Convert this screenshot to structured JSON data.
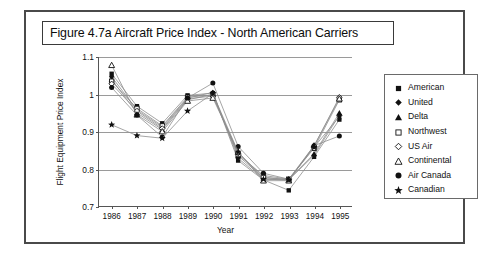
{
  "figure": {
    "title": "Figure 4.7a  Aircraft Price Index - North American Carriers"
  },
  "legend": {
    "items": [
      {
        "label": "American",
        "marker": "filled-square-marker"
      },
      {
        "label": "United",
        "marker": "filled-diamond-marker"
      },
      {
        "label": "Delta",
        "marker": "filled-triangle-marker"
      },
      {
        "label": "Northwest",
        "marker": "open-square-marker"
      },
      {
        "label": "US Air",
        "marker": "open-diamond-marker"
      },
      {
        "label": "Continental",
        "marker": "open-triangle-marker"
      },
      {
        "label": "Air Canada",
        "marker": "filled-circle-marker"
      },
      {
        "label": "Canadian",
        "marker": "star-marker"
      }
    ]
  },
  "chart_data": {
    "type": "line",
    "title": "Figure 4.7a  Aircraft Price Index - North American Carriers",
    "xlabel": "Year",
    "ylabel": "Flight Equipment Price Index",
    "x": [
      1986,
      1987,
      1988,
      1989,
      1990,
      1991,
      1992,
      1993,
      1994,
      1995
    ],
    "xticklabels": [
      "1986",
      "1987",
      "1988",
      "1989",
      "1990",
      "1991",
      "1992",
      "1993",
      "1994",
      "1995"
    ],
    "yticks": [
      0.7,
      0.8,
      0.9,
      1.0,
      1.1
    ],
    "yticklabels": [
      "0.7",
      "0.8",
      "0.9",
      "1",
      "1.1"
    ],
    "ylim": [
      0.7,
      1.1
    ],
    "grid": "horizontal",
    "legend_position": "right",
    "series": [
      {
        "name": "American",
        "marker": "filled-square-marker",
        "values": [
          1.055,
          0.968,
          0.922,
          0.997,
          1.003,
          0.822,
          0.77,
          0.742,
          0.832,
          0.932
        ]
      },
      {
        "name": "United",
        "marker": "filled-diamond-marker",
        "values": [
          1.047,
          0.958,
          0.912,
          0.99,
          1.005,
          0.828,
          0.772,
          0.77,
          0.836,
          0.944
        ]
      },
      {
        "name": "Delta",
        "marker": "filled-triangle-marker",
        "values": [
          1.04,
          0.95,
          0.905,
          0.985,
          1.0,
          0.835,
          0.775,
          0.772,
          0.84,
          0.95
        ]
      },
      {
        "name": "Northwest",
        "marker": "open-square-marker",
        "values": [
          1.035,
          0.962,
          0.915,
          0.992,
          0.998,
          0.838,
          0.782,
          0.772,
          0.855,
          0.985
        ]
      },
      {
        "name": "US Air",
        "marker": "open-diamond-marker",
        "values": [
          1.028,
          0.955,
          0.908,
          0.988,
          0.995,
          0.842,
          0.778,
          0.77,
          0.86,
          0.992
        ]
      },
      {
        "name": "Continental",
        "marker": "open-triangle-marker",
        "values": [
          1.078,
          0.945,
          0.9,
          0.982,
          0.99,
          0.845,
          0.768,
          0.768,
          0.862,
          0.988
        ]
      },
      {
        "name": "Air Canada",
        "marker": "filled-circle-marker",
        "values": [
          1.018,
          0.944,
          0.885,
          0.99,
          1.03,
          0.86,
          0.788,
          0.772,
          0.862,
          0.888
        ]
      },
      {
        "name": "Canadian",
        "marker": "star-marker",
        "values": [
          0.918,
          0.889,
          0.882,
          0.955,
          1.002,
          0.845,
          0.772,
          0.77,
          0.858,
          0.94
        ]
      }
    ]
  }
}
